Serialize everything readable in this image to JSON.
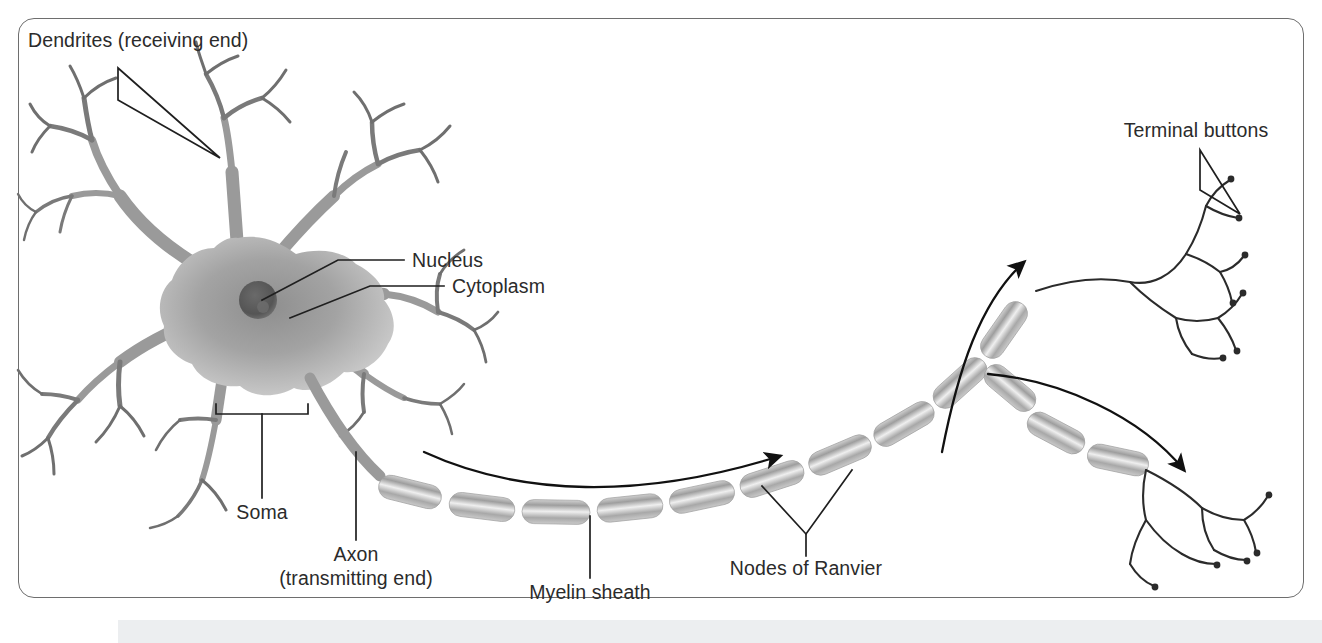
{
  "figure": {
    "kind": "anatomical-diagram",
    "frame_border_color": "#6e6e6e",
    "background_color": "#ffffff",
    "label_color": "#2b2b2b",
    "cell_fill_color": "#9a9a9a",
    "nucleus_color": "#5e5e5e",
    "myelin_color": "#b3b3b3",
    "arrow_color": "#111111"
  },
  "labels": {
    "dendrites": "Dendrites (receiving end)",
    "nucleus": "Nucleus",
    "cytoplasm": "Cytoplasm",
    "soma": "Soma",
    "axon_line1": "Axon",
    "axon_line2": "(transmitting end)",
    "myelin_sheath": "Myelin sheath",
    "nodes_of_ranvier": "Nodes of Ranvier",
    "terminal_buttons": "Terminal buttons"
  }
}
